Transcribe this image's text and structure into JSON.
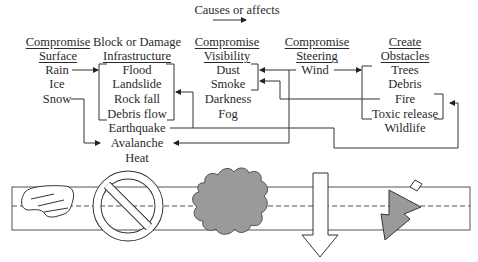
{
  "legend": {
    "label": "Causes or affects",
    "symbol": "right-arrow"
  },
  "columns": [
    {
      "id": "surface",
      "header": [
        "Compromise",
        "Surface"
      ],
      "underlined": true,
      "items": [
        "Rain",
        "Ice",
        "Snow"
      ]
    },
    {
      "id": "infrastructure",
      "header": [
        "Block or Damage",
        "Infrastructure"
      ],
      "underlined_second_line_only": true,
      "items": [
        "Flood",
        "Landslide",
        "Rock fall",
        "Debris flow",
        "Earthquake",
        "Avalanche",
        "Heat"
      ]
    },
    {
      "id": "visibility",
      "header": [
        "Compromise",
        "Visibility"
      ],
      "underlined": true,
      "items": [
        "Dust",
        "Smoke",
        "Darkness",
        "Fog"
      ]
    },
    {
      "id": "steering",
      "header": [
        "Compromise",
        "Steering"
      ],
      "underlined": true,
      "items": [
        "Wind"
      ]
    },
    {
      "id": "obstacles",
      "header": [
        "Create",
        "Obstacles"
      ],
      "underlined": true,
      "items": [
        "Trees",
        "Debris",
        "Fire",
        "Toxic release",
        "Wildlife"
      ]
    }
  ],
  "relations": [
    {
      "from": "Rain",
      "to": "Flood / Landslide / Rock fall / Debris flow (group)"
    },
    {
      "from": "Snow",
      "to": "Avalanche"
    },
    {
      "from": "Earthquake",
      "to": "Flood / Landslide / Rock fall / Debris flow (group)"
    },
    {
      "from": "Earthquake",
      "to": "Fire / Toxic release (group)"
    },
    {
      "from": "Wind",
      "to": "Dust / Smoke (group)"
    },
    {
      "from": "Wind",
      "to": "Trees / Debris / Fire / Toxic release (group)"
    },
    {
      "from": "Wind",
      "to": "Avalanche"
    },
    {
      "from": "Fire",
      "to": "Smoke"
    }
  ],
  "road_illustration": {
    "elements": [
      "slippery-surface-patch",
      "prohibition-sign",
      "smoke-cloud",
      "downward-arrow",
      "obstacle-triangle"
    ],
    "colors": {
      "cloud": "#9a9a9a",
      "obstacle": "#9a9a9a",
      "line": "#555555"
    }
  }
}
